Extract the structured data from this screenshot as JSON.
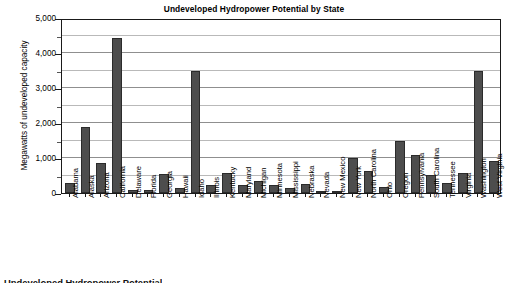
{
  "chart_data": {
    "type": "bar",
    "title": "Undeveloped Hydropower Potential by State",
    "xlabel": "",
    "ylabel": "Megawatts of undeveloped capacity",
    "ylim": [
      0,
      5000
    ],
    "ytick_interval": 1000,
    "minor_gridline_interval": 500,
    "grid": true,
    "legend": false,
    "bar_color": "#4d4d4d",
    "ytick_labels": [
      "0",
      "1,000",
      "2,000",
      "3,000",
      "4,000",
      "5,000"
    ],
    "ytick_values": [
      0,
      1000,
      2000,
      3000,
      4000,
      5000
    ],
    "categories": [
      "Alabama",
      "Alaska",
      "Arizona",
      "California",
      "Delaware",
      "Florida",
      "Georgia",
      "Hawaii",
      "Idaho",
      "Illinois",
      "Kentucky",
      "Maryland",
      "Michigan",
      "Minnesota",
      "Mississippi",
      "Nebraska",
      "Nevada",
      "New Mexico",
      "New York",
      "North Carolina",
      "Ohio",
      "Oregon",
      "Pennsylvania",
      "South Carolina",
      "Tennessee",
      "Virginia",
      "Washington",
      "West Virginia"
    ],
    "values": [
      290,
      1900,
      870,
      4430,
      100,
      100,
      540,
      150,
      3500,
      230,
      580,
      220,
      350,
      220,
      140,
      260,
      70,
      70,
      1000,
      620,
      180,
      1500,
      1080,
      510,
      300,
      560,
      3500,
      910
    ]
  },
  "caption": {
    "bottom_text": "Undeveloped Hydropower Potential"
  }
}
